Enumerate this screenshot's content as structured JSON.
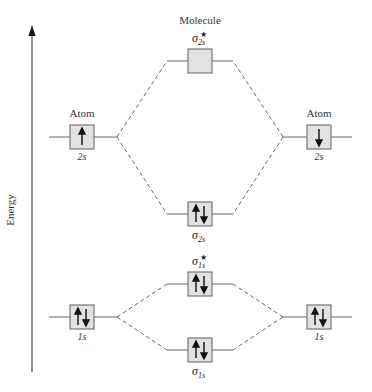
{
  "diagram": {
    "type": "molecular-orbital-diagram",
    "axis_label": "Energy",
    "headers": {
      "left": "Atom",
      "center": "Molecule",
      "right": "Atom"
    },
    "atomic_orbitals": {
      "left_2s": {
        "label": "2s",
        "electrons": "up"
      },
      "right_2s": {
        "label": "2s",
        "electrons": "down"
      },
      "left_1s": {
        "label": "1s",
        "electrons": "up-down"
      },
      "right_1s": {
        "label": "1s",
        "electrons": "up-down"
      }
    },
    "molecular_orbitals": {
      "sigma_star_2s": {
        "symbol": "σ",
        "sub": "2s",
        "star": "★",
        "electrons": "empty"
      },
      "sigma_2s": {
        "symbol": "σ",
        "sub": "2s",
        "star": "",
        "electrons": "up-down"
      },
      "sigma_star_1s": {
        "symbol": "σ",
        "sub": "1s",
        "star": "★",
        "electrons": "up-down"
      },
      "sigma_1s": {
        "symbol": "σ",
        "sub": "1s",
        "star": "",
        "electrons": "up-down"
      }
    },
    "colors": {
      "box_fill": "#e2e2e2",
      "box_stroke": "#777777",
      "line": "#666666",
      "arrow": "#111111"
    }
  }
}
